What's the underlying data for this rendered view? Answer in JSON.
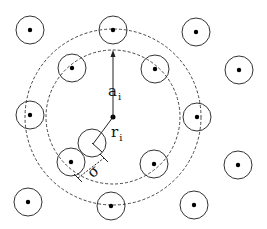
{
  "diagram": {
    "colors": {
      "stroke": "#333333",
      "dot": "#000000",
      "background": "#ffffff"
    },
    "center": {
      "x": 113,
      "y": 117
    },
    "dashed_rings": [
      {
        "name": "outer-ring",
        "r": 88
      },
      {
        "name": "inner-ring",
        "r": 67
      }
    ],
    "particle_radius": 14,
    "particles": [
      {
        "x": 30,
        "y": 30
      },
      {
        "x": 113,
        "y": 30
      },
      {
        "x": 196,
        "y": 32
      },
      {
        "x": 72,
        "y": 68
      },
      {
        "x": 155,
        "y": 69
      },
      {
        "x": 239,
        "y": 70
      },
      {
        "x": 30,
        "y": 115
      },
      {
        "x": 197,
        "y": 117
      },
      {
        "x": 71,
        "y": 162
      },
      {
        "x": 154,
        "y": 164
      },
      {
        "x": 238,
        "y": 165
      },
      {
        "x": 28,
        "y": 202
      },
      {
        "x": 111,
        "y": 206
      },
      {
        "x": 194,
        "y": 205
      }
    ],
    "labels": {
      "a_main": "a",
      "a_sub": "i",
      "r_main": "r",
      "r_sub": "i",
      "sigma": "σ"
    }
  }
}
